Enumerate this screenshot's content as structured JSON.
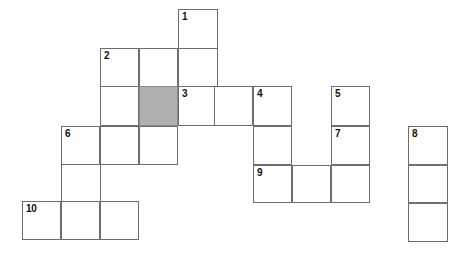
{
  "puzzle": {
    "title": "Crossword Grid",
    "type": "crossword",
    "cell_size": 39,
    "colors": {
      "background": "#ffffff",
      "cell_fill": "#ffffff",
      "cell_border": "#6e6e6e",
      "shaded_fill": "#b0b0b0",
      "number_text": "#111111"
    },
    "numbered_clues": [
      "1",
      "2",
      "3",
      "4",
      "5",
      "6",
      "7",
      "8",
      "9",
      "10"
    ],
    "shaded_cell_count": 1,
    "cells": [
      {
        "id": "cell-r0c4",
        "x": 178,
        "y": 9,
        "w": 40,
        "h": 40,
        "number": "1",
        "shaded": false
      },
      {
        "id": "cell-r1c2",
        "x": 100,
        "y": 48,
        "w": 39,
        "h": 39,
        "number": "2",
        "shaded": false
      },
      {
        "id": "cell-r1c3",
        "x": 139,
        "y": 48,
        "w": 39,
        "h": 39,
        "number": "",
        "shaded": false
      },
      {
        "id": "cell-r1c4",
        "x": 178,
        "y": 48,
        "w": 40,
        "h": 39,
        "number": "",
        "shaded": false
      },
      {
        "id": "cell-r2c2",
        "x": 100,
        "y": 86,
        "w": 39,
        "h": 40,
        "number": "",
        "shaded": false
      },
      {
        "id": "cell-r2c3",
        "x": 139,
        "y": 86,
        "w": 39,
        "h": 40,
        "number": "",
        "shaded": true
      },
      {
        "id": "cell-r2c4",
        "x": 178,
        "y": 86,
        "w": 40,
        "h": 40,
        "number": "3",
        "shaded": false
      },
      {
        "id": "cell-r2c5",
        "x": 214,
        "y": 86,
        "w": 39,
        "h": 40,
        "number": "",
        "shaded": false
      },
      {
        "id": "cell-r2c6",
        "x": 253,
        "y": 86,
        "w": 39,
        "h": 40,
        "number": "4",
        "shaded": false
      },
      {
        "id": "cell-r2c8",
        "x": 331,
        "y": 86,
        "w": 39,
        "h": 40,
        "number": "5",
        "shaded": false
      },
      {
        "id": "cell-r3c1",
        "x": 61,
        "y": 126,
        "w": 39,
        "h": 39,
        "number": "6",
        "shaded": false
      },
      {
        "id": "cell-r3c2",
        "x": 100,
        "y": 126,
        "w": 39,
        "h": 39,
        "number": "",
        "shaded": false
      },
      {
        "id": "cell-r3c3",
        "x": 139,
        "y": 126,
        "w": 39,
        "h": 39,
        "number": "",
        "shaded": false
      },
      {
        "id": "cell-r3c6",
        "x": 253,
        "y": 126,
        "w": 39,
        "h": 39,
        "number": "",
        "shaded": false
      },
      {
        "id": "cell-r3c8",
        "x": 331,
        "y": 126,
        "w": 39,
        "h": 39,
        "number": "7",
        "shaded": false
      },
      {
        "id": "cell-r3c10",
        "x": 408,
        "y": 126,
        "w": 40,
        "h": 39,
        "number": "8",
        "shaded": false
      },
      {
        "id": "cell-r4c6",
        "x": 253,
        "y": 165,
        "w": 39,
        "h": 38,
        "number": "9",
        "shaded": false
      },
      {
        "id": "cell-r4c7",
        "x": 292,
        "y": 165,
        "w": 39,
        "h": 38,
        "number": "",
        "shaded": false
      },
      {
        "id": "cell-r4c8",
        "x": 331,
        "y": 165,
        "w": 39,
        "h": 38,
        "number": "",
        "shaded": false
      },
      {
        "id": "cell-r4c10",
        "x": 408,
        "y": 165,
        "w": 40,
        "h": 38,
        "number": "",
        "shaded": false
      },
      {
        "id": "cell-r5c0",
        "x": 22,
        "y": 201,
        "w": 39,
        "h": 39,
        "number": "10",
        "shaded": false
      },
      {
        "id": "cell-r5c1",
        "x": 61,
        "y": 201,
        "w": 39,
        "h": 39,
        "number": "",
        "shaded": false
      },
      {
        "id": "cell-r5c2",
        "x": 100,
        "y": 201,
        "w": 39,
        "h": 39,
        "number": "",
        "shaded": false
      },
      {
        "id": "cell-r5c10",
        "x": 408,
        "y": 203,
        "w": 40,
        "h": 39,
        "number": "",
        "shaded": false
      }
    ],
    "connectors": [
      {
        "id": "connector-col1",
        "x": 61,
        "y": 165,
        "w": 1,
        "h": 36
      },
      {
        "id": "connector-col2",
        "x": 100,
        "y": 165,
        "w": 1,
        "h": 36
      }
    ]
  }
}
